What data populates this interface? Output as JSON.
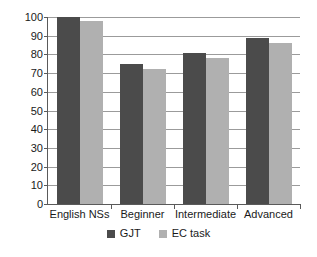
{
  "chart_data": {
    "type": "bar",
    "title": "",
    "xlabel": "",
    "ylabel": "",
    "ylim": [
      0,
      100
    ],
    "yticks": [
      0,
      10,
      20,
      30,
      40,
      50,
      60,
      70,
      80,
      90,
      100
    ],
    "ytick_labels": [
      "0",
      "10",
      "20",
      "30",
      "40",
      "50",
      "60",
      "70",
      "80",
      "90",
      "100"
    ],
    "grid": true,
    "legend_position": "bottom",
    "categories": [
      "English NSs",
      "Beginner",
      "Intermediate",
      "Advanced"
    ],
    "series": [
      {
        "name": "GJT",
        "color": "#4b4b4b",
        "values": [
          100,
          75,
          81,
          89
        ]
      },
      {
        "name": "EC task",
        "color": "#b0b0b0",
        "values": [
          98,
          72,
          78,
          86
        ]
      }
    ]
  },
  "legend": {
    "entries": [
      {
        "label": "GJT"
      },
      {
        "label": "EC task"
      }
    ]
  },
  "colors": {
    "series_gjt": "#4b4b4b",
    "series_ec": "#b0b0b0",
    "gridline": "#9b9b9b",
    "axis": "#5a5a5a",
    "text": "#1a1a1a",
    "background": "#ffffff"
  }
}
